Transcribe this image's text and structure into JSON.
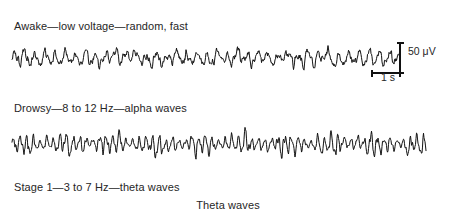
{
  "figure": {
    "title_caption": "Theta waves",
    "background_color": "#ffffff",
    "trace_color": "#111111",
    "text_color": "#262626",
    "width": 456,
    "height": 214
  },
  "traces": [
    {
      "id": "awake",
      "label": "Awake—low voltage—random, fast",
      "state": "Awake",
      "description": "low voltage—random, fast",
      "frequency_band": "",
      "wave_name": "beta waves",
      "baseline_y": 20,
      "x_start": 12,
      "x_end": 400,
      "amplitude": 8.5,
      "base_frequency": 0.62,
      "noise": 0.62,
      "burst_strength": 0.25,
      "burst_period": 70,
      "seed": 1347
    },
    {
      "id": "drowsy",
      "label": "Drowsy—8 to 12 Hz—alpha waves",
      "state": "Drowsy",
      "description": "8 to 12 Hz",
      "frequency_band": "8 to 12 Hz",
      "wave_name": "alpha waves",
      "baseline_y": 22,
      "x_start": 12,
      "x_end": 426,
      "amplitude": 13.5,
      "base_frequency": 0.95,
      "noise": 0.3,
      "burst_strength": 0.72,
      "burst_period": 44,
      "seed": 8821
    },
    {
      "id": "stage1",
      "label": "Stage 1—3 to 7 Hz—theta waves",
      "state": "Stage 1",
      "description": "3 to 7 Hz",
      "frequency_band": "3 to 7 Hz",
      "wave_name": "theta waves",
      "baseline_y": 0,
      "x_start": 12,
      "x_end": 426,
      "amplitude": 0,
      "base_frequency": 0.4,
      "noise": 0.25,
      "burst_strength": 0.4,
      "burst_period": 60,
      "seed": 551
    }
  ],
  "scale_bar": {
    "voltage_label": "50 μV",
    "voltage_value": 50,
    "voltage_unit": "μV",
    "time_label": "1 s",
    "time_value": 1,
    "time_unit": "s",
    "vertical_px": 30,
    "horizontal_px": 28
  }
}
